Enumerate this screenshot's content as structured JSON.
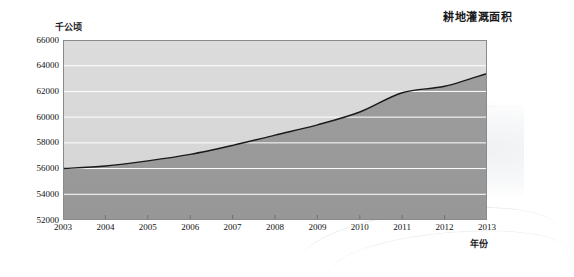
{
  "chart_data": {
    "type": "area",
    "title": "耕地灌溉面积",
    "xlabel": "年份",
    "ylabel": "千公顷",
    "categories": [
      2003,
      2004,
      2005,
      2006,
      2007,
      2008,
      2009,
      2010,
      2011,
      2012,
      2013
    ],
    "x_tick_labels": [
      "2003",
      "2004",
      "2005",
      "2006",
      "2007",
      "2008",
      "2009",
      "2010",
      "2011",
      "2012",
      "2013"
    ],
    "y_tick_labels": [
      "66000",
      "64000",
      "62000",
      "60000",
      "58000",
      "56000",
      "54000",
      "52000"
    ],
    "y_ticks": [
      66000,
      64000,
      62000,
      60000,
      58000,
      56000,
      54000,
      52000
    ],
    "values": [
      56000,
      56200,
      56600,
      57100,
      57800,
      58600,
      59400,
      60400,
      61900,
      62400,
      63400
    ],
    "series": [
      {
        "name": "耕地灌溉面积",
        "values": [
          56000,
          56200,
          56600,
          57100,
          57800,
          58600,
          59400,
          60400,
          61900,
          62400,
          63400
        ]
      }
    ],
    "xlim": [
      2003,
      2013
    ],
    "ylim": [
      52000,
      66000
    ],
    "grid": true,
    "grid_color": "#ffffff",
    "legend": "none",
    "legend_position": "none",
    "colors": {
      "area_below_line": "#9a9a9a",
      "area_above_line": "#d9d9d9",
      "line": "#1a1a1a",
      "plot_border": "#8a8a8a",
      "axis_text": "#111111"
    }
  }
}
